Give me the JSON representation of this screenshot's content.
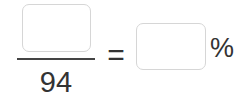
{
  "equation": {
    "numerator": {
      "value": "",
      "type": "input-box"
    },
    "denominator": "94",
    "equals": "=",
    "result": {
      "value": "",
      "type": "input-box"
    },
    "unit": "%"
  },
  "colors": {
    "text": "#333333",
    "box_border": "#d6d6d6",
    "fraction_bar": "#444444",
    "background": "#ffffff"
  }
}
